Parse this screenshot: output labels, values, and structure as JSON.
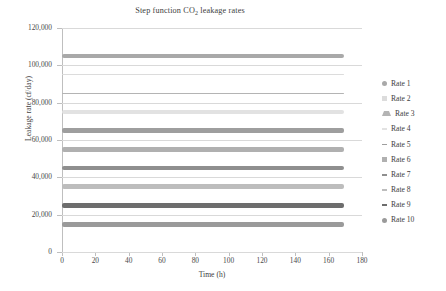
{
  "chart_data": {
    "type": "line",
    "title": "Step function CO2 leakage rates",
    "title_prefix": "Step function CO",
    "title_subscript": "2",
    "title_suffix": " leakage rates",
    "xlabel": "Time (h)",
    "ylabel": "Leakage rate (cf/day)",
    "xlim": [
      0,
      180
    ],
    "ylim": [
      0,
      120000
    ],
    "xticks": [
      "0",
      "20",
      "40",
      "60",
      "80",
      "100",
      "120",
      "140",
      "160",
      "180"
    ],
    "xtick_values": [
      0,
      20,
      40,
      60,
      80,
      100,
      120,
      140,
      160,
      180
    ],
    "yticks": [
      "0",
      "20,000",
      "40,000",
      "60,000",
      "80,000",
      "100,000",
      "120,000"
    ],
    "ytick_values": [
      0,
      20000,
      40000,
      60000,
      80000,
      100000,
      120000
    ],
    "grid": true,
    "legend_position": "right",
    "x_start": 0,
    "x_end": 169,
    "series": [
      {
        "name": "Rate 1",
        "value": 105000,
        "color": "#a9a9a9",
        "thickness": 4.0,
        "marker": "circle"
      },
      {
        "name": "Rate 2",
        "value": 95000,
        "color": "#dcdcdc",
        "thickness": 1.6,
        "marker": "square"
      },
      {
        "name": "Rate 3",
        "value": 85000,
        "color": "#b4b4b4",
        "thickness": 1.6,
        "marker": "triangle"
      },
      {
        "name": "Rate 4",
        "value": 75000,
        "color": "#e2e2e2",
        "thickness": 4.4,
        "marker": "dash"
      },
      {
        "name": "Rate 5",
        "value": 65000,
        "color": "#9e9e9e",
        "thickness": 5.0,
        "marker": "dash"
      },
      {
        "name": "Rate 6",
        "value": 55000,
        "color": "#b0b0b0",
        "thickness": 4.6,
        "marker": "square"
      },
      {
        "name": "Rate 7",
        "value": 45000,
        "color": "#8f8f8f",
        "thickness": 4.6,
        "marker": "dash"
      },
      {
        "name": "Rate 8",
        "value": 35000,
        "color": "#bdbdbd",
        "thickness": 4.6,
        "marker": "dash"
      },
      {
        "name": "Rate 9",
        "value": 25000,
        "color": "#6d6d6d",
        "thickness": 5.2,
        "marker": "dash"
      },
      {
        "name": "Rate 10",
        "value": 15000,
        "color": "#9a9a9a",
        "thickness": 5.0,
        "marker": "circle"
      }
    ]
  }
}
